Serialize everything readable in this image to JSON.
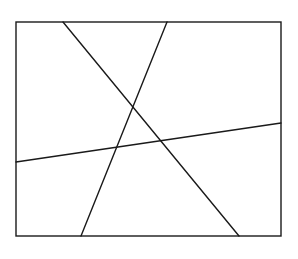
{
  "canvas": {
    "width": 298,
    "height": 259,
    "background": "#ffffff"
  },
  "stroke": {
    "color": "#1a1a1a",
    "width": 1.4
  },
  "rectangle": {
    "x1": 16,
    "y1": 22,
    "x2": 281,
    "y2": 236
  },
  "lines": [
    {
      "name": "line-a",
      "x1": 63,
      "y1": 22,
      "x2": 239,
      "y2": 236
    },
    {
      "name": "line-b",
      "x1": 167,
      "y1": 22,
      "x2": 81,
      "y2": 236
    },
    {
      "name": "line-c",
      "x1": 16,
      "y1": 162,
      "x2": 281,
      "y2": 123
    }
  ]
}
